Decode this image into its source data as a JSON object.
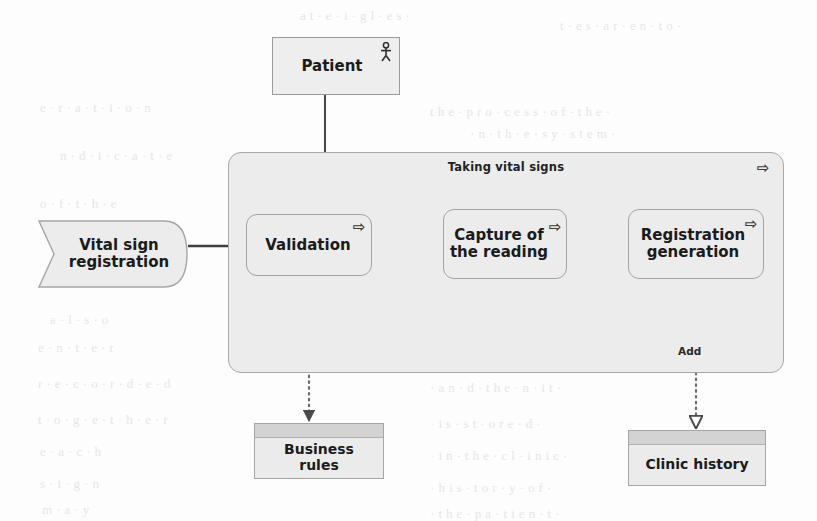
{
  "diagram": {
    "type": "uml-activity-diagram",
    "background_color": "#fdfdfd",
    "node_fill": "#ececec",
    "node_stroke": "#a3a3a3",
    "store_header_fill": "#d3d3d3",
    "text_color": "#1b1b1b"
  },
  "actor": {
    "label": "Patient",
    "icon": "actor-stick-figure-icon"
  },
  "container": {
    "title": "Taking vital signs",
    "marker": "⇨",
    "marker_icon": "subprocess-arrow-icon"
  },
  "activities": [
    {
      "id": "validation",
      "label": "Validation",
      "marker": "⇨"
    },
    {
      "id": "capture",
      "label": "Capture of\nthe reading",
      "marker": "⇨"
    },
    {
      "id": "registration",
      "label": "Registration\ngeneration",
      "marker": "⇨"
    }
  ],
  "input": {
    "label": "Vital sign\nregistration",
    "shape": "flag-banner"
  },
  "stores": [
    {
      "id": "business-rules",
      "label": "Business\nrules"
    },
    {
      "id": "clinic-history",
      "label": "Clinic history"
    }
  ],
  "edges": [
    {
      "from": "vital-sign-registration",
      "to": "validation",
      "style": "solid",
      "arrow": "filled",
      "label": ""
    },
    {
      "from": "validation",
      "to": "capture",
      "style": "solid",
      "arrow": "filled",
      "label": ""
    },
    {
      "from": "capture",
      "to": "registration",
      "style": "solid",
      "arrow": "filled",
      "label": ""
    },
    {
      "from": "patient",
      "to": "container",
      "style": "solid",
      "arrow": "none",
      "label": ""
    },
    {
      "from": "validation",
      "to": "business-rules",
      "style": "dotted",
      "arrow": "filled",
      "label": ""
    },
    {
      "from": "registration",
      "to": "clinic-history",
      "style": "dotted",
      "arrow": "hollow",
      "label": "Add"
    }
  ],
  "bleed_text": [
    {
      "text": "a  t · e · i  ·  g  l  · e  s  ·",
      "x": 300,
      "y": 8
    },
    {
      "text": "t  ·  e    s  ·  a  r  ·    e  n  ·  t  o  ·",
      "x": 560,
      "y": 18
    },
    {
      "text": "e  · r  · a  · t  · i  · o  · n",
      "x": 40,
      "y": 100
    },
    {
      "text": "t h e  ·  p  r o  · c  e s s  ·  o f  ·  t h e  ·",
      "x": 430,
      "y": 104
    },
    {
      "text": "· n   ·  t h  · e   ·  s y  · s t e m  ·",
      "x": 470,
      "y": 126
    },
    {
      "text": "n  · d  · i  · c  · a  · t  · e",
      "x": 60,
      "y": 148
    },
    {
      "text": "·  r  e  g  · i  s  · t  r  a  · t  i  o  n  ·",
      "x": 430,
      "y": 190
    },
    {
      "text": "o  · f    · t  · h  · e",
      "x": 40,
      "y": 196
    },
    {
      "text": "a  · l  · s  · o",
      "x": 50,
      "y": 312
    },
    {
      "text": "· t h e  · r  · e s u  · l t  · i n g  ·",
      "x": 430,
      "y": 318
    },
    {
      "text": "e  · n  · t  · e  · r",
      "x": 38,
      "y": 340
    },
    {
      "text": "· t  h  · e    · r  e  · c  o  r  · d  ·",
      "x": 430,
      "y": 344
    },
    {
      "text": "r  · e  · c  · o  · r  · d  · e  · d",
      "x": 38,
      "y": 376
    },
    {
      "text": "· a  n  · d    · t  h  e  · n    · i  t  ·",
      "x": 430,
      "y": 380
    },
    {
      "text": "t  · o  · g  · e  · t  · h  · e  · r",
      "x": 38,
      "y": 412
    },
    {
      "text": "· i  s    · s  t  · o  r  e  · d  ·",
      "x": 430,
      "y": 416
    },
    {
      "text": "e  · a  · c  · h",
      "x": 40,
      "y": 444
    },
    {
      "text": "· i n  · t  h e  · c l  · i n i c  ·",
      "x": 430,
      "y": 448
    },
    {
      "text": "s  · i  · g  · n",
      "x": 40,
      "y": 476
    },
    {
      "text": "· h  i  s  · t  o  r  · y    · o  f  ·",
      "x": 430,
      "y": 480
    },
    {
      "text": "m  · a  · y",
      "x": 42,
      "y": 502
    },
    {
      "text": "· t  h  e  ·   p  a  · t  i  e  n  · t  ·",
      "x": 430,
      "y": 506
    }
  ]
}
